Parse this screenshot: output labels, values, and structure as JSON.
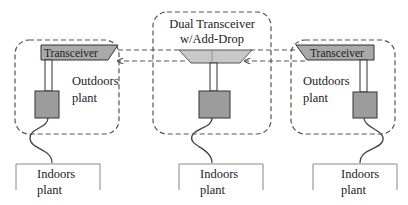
{
  "diagram": {
    "colors": {
      "dashed_line": "#555555",
      "transceiver_fill": "#a9a9a9",
      "addrop_fill": "#c8c8c8",
      "plant_box_fill": "#9c9c9c",
      "stroke": "#333333"
    },
    "left_site": {
      "transceiver_label": "Transceiver",
      "outdoors_label_line1": "Outdoors",
      "outdoors_label_line2": "plant",
      "indoors_label_line1": "Indoors",
      "indoors_label_line2": "plant"
    },
    "center_site": {
      "title_line1": "Dual Transceiver",
      "title_line2": "w/Add-Drop",
      "indoors_label_line1": "Indoors",
      "indoors_label_line2": "plant"
    },
    "right_site": {
      "transceiver_label": "Transceiver",
      "outdoors_label_line1": "Outdoors",
      "outdoors_label_line2": "plant",
      "indoors_label_line1": "Indoors",
      "indoors_label_line2": "plant"
    },
    "links": [
      {
        "from": "left-transceiver",
        "to": "add-drop",
        "direction": "right"
      },
      {
        "from": "add-drop",
        "to": "left-transceiver",
        "direction": "left"
      },
      {
        "from": "add-drop",
        "to": "right-transceiver",
        "direction": "right"
      },
      {
        "from": "right-transceiver",
        "to": "add-drop",
        "direction": "left"
      }
    ]
  }
}
